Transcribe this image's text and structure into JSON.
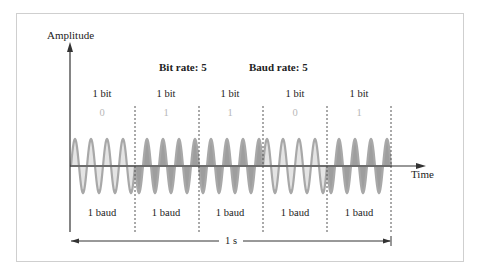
{
  "diagram": {
    "y_axis_label": "Amplitude",
    "x_axis_label": "Time",
    "header": {
      "bit_rate": "Bit rate: 5",
      "baud_rate": "Baud rate: 5"
    },
    "segments": [
      {
        "bit_label": "1 bit",
        "bit_value": "0",
        "baud_label": "1 baud"
      },
      {
        "bit_label": "1 bit",
        "bit_value": "1",
        "baud_label": "1 baud"
      },
      {
        "bit_label": "1 bit",
        "bit_value": "1",
        "baud_label": "1 baud"
      },
      {
        "bit_label": "1 bit",
        "bit_value": "0",
        "baud_label": "1 baud"
      },
      {
        "bit_label": "1 bit",
        "bit_value": "1",
        "baud_label": "1 baud"
      }
    ],
    "duration_label": "1 s",
    "colors": {
      "bit0_fill": "#e4e4e4",
      "bit1_fill": "#9e9e9e",
      "wave_stroke": "#a8a8a8",
      "axis": "#333333",
      "divider": "#555555",
      "bit_value_text": "#b8b8b8"
    }
  }
}
